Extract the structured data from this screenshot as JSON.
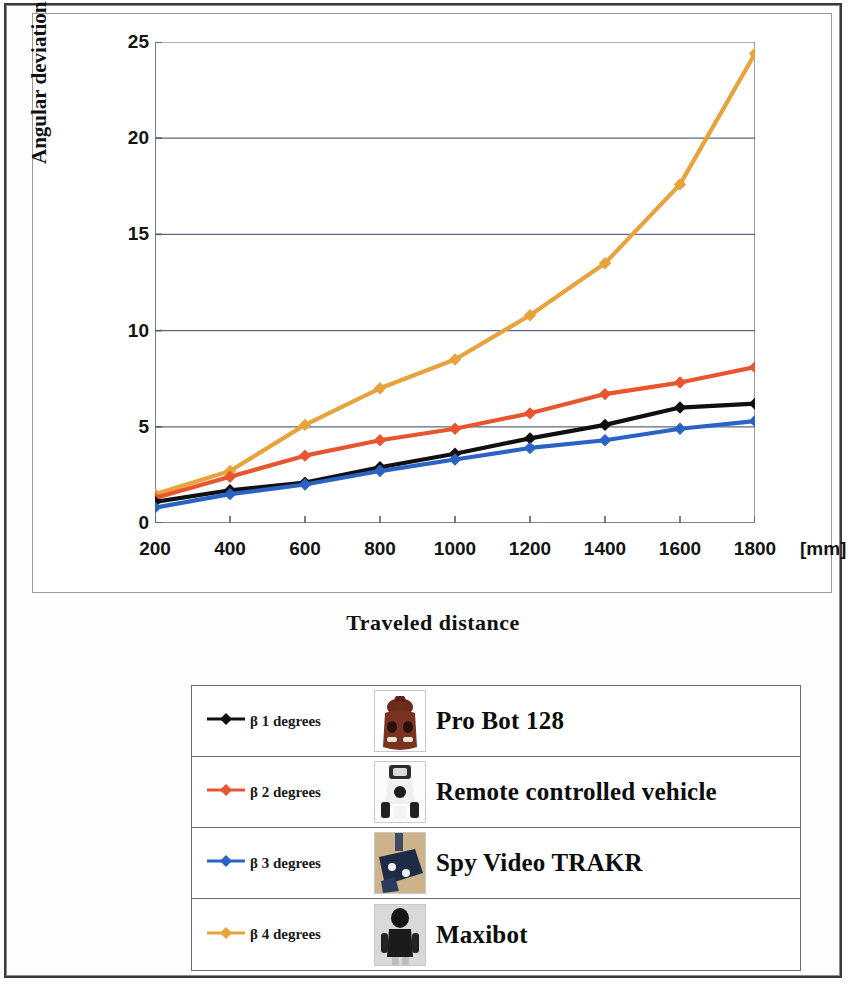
{
  "chart_data": {
    "type": "line",
    "title": "",
    "xlabel": "Traveled distance",
    "ylabel": "Angular deviation",
    "x_unit": "[mm]",
    "x": [
      200,
      400,
      600,
      800,
      1000,
      1200,
      1400,
      1600,
      1800
    ],
    "categories": [
      "200",
      "400",
      "600",
      "800",
      "1000",
      "1200",
      "1400",
      "1600",
      "1800"
    ],
    "xtick_labels": [
      "200",
      "400",
      "600",
      "800",
      "1000",
      "1200",
      "1400",
      "1600",
      "1800"
    ],
    "ytick_labels": [
      "0",
      "5",
      "10",
      "15",
      "20",
      "25"
    ],
    "yticks": [
      0,
      5,
      10,
      15,
      20,
      25
    ],
    "ylim": [
      0,
      25
    ],
    "xlim": [
      200,
      1800
    ],
    "grid": "horizontal",
    "legend_position": "below-table",
    "series": [
      {
        "name": "β 1 degrees",
        "device": "Pro Bot 128",
        "color": "#101010",
        "marker": "diamond",
        "values": [
          1.1,
          1.7,
          2.1,
          2.9,
          3.6,
          4.4,
          5.1,
          6.0,
          6.2
        ]
      },
      {
        "name": "β 2  degrees",
        "device": "Remote controlled vehicle",
        "color": "#E8552F",
        "marker": "diamond",
        "values": [
          1.3,
          2.4,
          3.5,
          4.3,
          4.9,
          5.7,
          6.7,
          7.3,
          8.1
        ]
      },
      {
        "name": "β 3 degrees",
        "device": "Spy Video TRAKR",
        "color": "#2B63C4",
        "marker": "diamond",
        "values": [
          0.8,
          1.5,
          2.0,
          2.7,
          3.3,
          3.9,
          4.3,
          4.9,
          5.3
        ]
      },
      {
        "name": "β 4 degrees",
        "device": "Maxibot",
        "color": "#E8A33D",
        "marker": "diamond",
        "values": [
          1.5,
          2.7,
          5.1,
          7.0,
          8.5,
          10.8,
          13.5,
          17.6,
          24.4
        ]
      }
    ]
  },
  "legend": {
    "rows": [
      {
        "key": "β 1 degrees",
        "device": "Pro Bot 128",
        "color": "#101010",
        "thumb": "pro-bot-128-photo"
      },
      {
        "key": "β 2  degrees",
        "device": "Remote controlled vehicle",
        "color": "#E8552F",
        "thumb": "remote-controlled-vehicle-photo"
      },
      {
        "key": "β 3 degrees",
        "device": "Spy Video TRAKR",
        "color": "#2B63C4",
        "thumb": "spy-video-trakr-photo"
      },
      {
        "key": "β 4 degrees",
        "device": "Maxibot",
        "color": "#E8A33D",
        "thumb": "maxibot-photo"
      }
    ]
  },
  "colors": {
    "axis": "#555f70",
    "gridline": "#5b6780",
    "frame": "#9a9a9a",
    "text": "#121212"
  }
}
